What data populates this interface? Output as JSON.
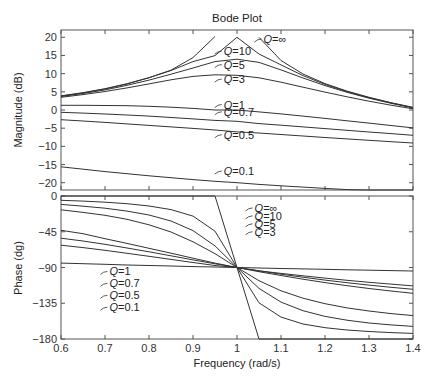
{
  "chart_data": [
    {
      "type": "line",
      "title": "Bode Plot",
      "xlabel": "Frequency (rad/s)",
      "ylabel": "Magnitude (dB)",
      "xlim": [
        0.6,
        1.4
      ],
      "ylim": [
        -22,
        22
      ],
      "x_ticks": [
        0.6,
        0.7,
        0.8,
        0.9,
        1,
        1.1,
        1.2,
        1.3,
        1.4
      ],
      "x_tick_labels": [
        "0.6",
        "0.7",
        "0.8",
        "0.9",
        "1",
        "1.1",
        "1.2",
        "1.3",
        "1.4"
      ],
      "y_ticks": [
        20,
        15,
        10,
        5,
        0,
        -5,
        -10,
        -15,
        -20
      ],
      "y_tick_labels": [
        "20",
        "15",
        "10",
        "5",
        "0",
        "−5",
        "−10",
        "−15",
        "−20"
      ],
      "grid": false,
      "x": [
        0.6,
        0.65,
        0.7,
        0.75,
        0.8,
        0.85,
        0.9,
        0.95,
        1.0,
        1.05,
        1.1,
        1.15,
        1.2,
        1.25,
        1.3,
        1.35,
        1.4
      ],
      "series": [
        {
          "name": "Q = ∞",
          "values": [
            3.88,
            4.75,
            5.85,
            7.23,
            8.87,
            10.94,
            14.42,
            20.2,
            null,
            20.0,
            13.62,
            9.91,
            7.27,
            5.2,
            3.48,
            2.0,
            0.72
          ]
        },
        {
          "name": "Q = 10",
          "values": [
            3.84,
            4.7,
            5.78,
            7.15,
            8.87,
            10.87,
            13.3,
            14.96,
            20.0,
            15.4,
            12.4,
            9.45,
            7.05,
            5.06,
            3.4,
            1.95,
            0.67
          ]
        },
        {
          "name": "Q = 5",
          "values": [
            3.72,
            4.55,
            5.54,
            6.78,
            8.23,
            9.84,
            11.56,
            13.3,
            13.98,
            13.1,
            11.04,
            8.79,
            6.72,
            4.86,
            3.25,
            1.83,
            0.58
          ]
        },
        {
          "name": "Q = 3",
          "values": [
            3.5,
            4.23,
            5.09,
            6.09,
            7.19,
            8.31,
            9.23,
            9.69,
            9.54,
            8.85,
            7.64,
            6.28,
            4.92,
            3.63,
            2.43,
            1.33,
            0.32
          ]
        },
        {
          "name": "Q = 1",
          "values": [
            1.29,
            1.29,
            1.25,
            1.17,
            1.02,
            0.78,
            0.44,
            0.01,
            0.0,
            -0.52,
            -1.08,
            -1.68,
            -2.31,
            -2.96,
            -3.61,
            -4.26,
            -4.91
          ]
        },
        {
          "name": "Q = 0.7",
          "values": [
            -0.64,
            -0.85,
            -1.09,
            -1.37,
            -1.69,
            -2.05,
            -2.44,
            -2.86,
            -3.1,
            -3.74,
            -4.19,
            -4.65,
            -5.12,
            -5.58,
            -6.04,
            -6.5,
            -6.96
          ]
        },
        {
          "name": "Q = 0.5",
          "values": [
            -2.66,
            -3.03,
            -3.42,
            -3.82,
            -4.23,
            -4.65,
            -5.07,
            -5.49,
            -6.02,
            -6.33,
            -6.74,
            -7.14,
            -7.55,
            -7.94,
            -8.33,
            -8.71,
            -9.08
          ]
        },
        {
          "name": "Q = 0.1",
          "values": [
            -15.62,
            -16.29,
            -16.93,
            -17.53,
            -18.1,
            -18.63,
            -19.13,
            -19.6,
            -20.0,
            -20.45,
            -20.85,
            -21.21,
            -21.56,
            -21.88,
            -22.19,
            -22.47,
            -22.74
          ]
        }
      ],
      "annotations": [
        {
          "text": "Q = ∞",
          "x": 1.06,
          "y": 19.5
        },
        {
          "text": "Q = 10",
          "x": 0.97,
          "y": 16.2
        },
        {
          "text": "Q = 5",
          "x": 0.97,
          "y": 12.5
        },
        {
          "text": "Q = 3",
          "x": 0.97,
          "y": 8.5
        },
        {
          "text": "Q = 1",
          "x": 0.97,
          "y": 1.5
        },
        {
          "text": "Q = 0.7",
          "x": 0.97,
          "y": -0.5
        },
        {
          "text": "Q = 0.5",
          "x": 0.97,
          "y": -6.8
        },
        {
          "text": "Q = 0.1",
          "x": 0.97,
          "y": -16.8
        }
      ]
    },
    {
      "type": "line",
      "title": "",
      "xlabel": "Frequency (rad/s)",
      "ylabel": "Phase (dg)",
      "xlim": [
        0.6,
        1.4
      ],
      "ylim": [
        -180,
        0
      ],
      "x_ticks": [
        0.6,
        0.7,
        0.8,
        0.9,
        1,
        1.1,
        1.2,
        1.3,
        1.4
      ],
      "x_tick_labels": [
        "0.6",
        "0.7",
        "0.8",
        "0.9",
        "1",
        "1.1",
        "1.2",
        "1.3",
        "1.4"
      ],
      "y_ticks": [
        0,
        -45,
        -90,
        -135,
        -180
      ],
      "y_tick_labels": [
        "0",
        "−45",
        "−90",
        "−135",
        "−180"
      ],
      "grid": false,
      "x": [
        0.6,
        0.65,
        0.7,
        0.75,
        0.8,
        0.85,
        0.9,
        0.95,
        1.0,
        1.05,
        1.1,
        1.15,
        1.2,
        1.25,
        1.3,
        1.35,
        1.4
      ],
      "series": [
        {
          "name": "Q = ∞",
          "values": [
            0,
            0,
            0,
            0,
            0,
            0,
            0,
            0,
            -90,
            -180,
            -180,
            -180,
            -180,
            -180,
            -180,
            -180,
            -180
          ]
        },
        {
          "name": "Q = 10",
          "values": [
            -5.36,
            -6.48,
            -7.8,
            -9.72,
            -12.53,
            -17.06,
            -25.35,
            -44.3,
            -90,
            -134.4,
            -152.4,
            -161.1,
            -165.8,
            -168.7,
            -170.6,
            -171.9,
            -172.9
          ]
        },
        {
          "name": "Q = 5",
          "values": [
            -10.62,
            -12.79,
            -15.34,
            -18.95,
            -23.96,
            -31.5,
            -43.5,
            -62.8,
            -90,
            -116.3,
            -133.5,
            -144.4,
            -151.6,
            -156.3,
            -159.8,
            -162.3,
            -164.2
          ]
        },
        {
          "name": "Q = 3",
          "values": [
            -17.35,
            -20.7,
            -24.35,
            -29.38,
            -36.2,
            -45.3,
            -57.6,
            -72.6,
            -90,
            -106.6,
            -119.3,
            -128.7,
            -135.6,
            -140.8,
            -144.8,
            -148.0,
            -150.5
          ]
        },
        {
          "name": "Q = 1",
          "values": [
            -43.15,
            -47.4,
            -53.7,
            -59.7,
            -65.8,
            -72.0,
            -78.3,
            -84.4,
            -90,
            -95.3,
            -100.1,
            -104.7,
            -109.0,
            -112.9,
            -116.4,
            -119.6,
            -122.5
          ]
        },
        {
          "name": "Q = 0.7",
          "values": [
            -53.1,
            -56.6,
            -60.8,
            -65.4,
            -70.3,
            -75.3,
            -80.4,
            -85.3,
            -90,
            -94.3,
            -98.4,
            -102.2,
            -105.8,
            -109.1,
            -112.1,
            -114.9,
            -117.4
          ]
        },
        {
          "name": "Q = 0.5",
          "values": [
            -61.9,
            -65.0,
            -68.4,
            -72.1,
            -75.9,
            -79.8,
            -83.7,
            -87.5,
            -90,
            -94.1,
            -97.4,
            -100.5,
            -103.4,
            -106.1,
            -108.6,
            -110.9,
            -113.1
          ]
        },
        {
          "name": "Q = 0.1",
          "values": [
            -84.5,
            -85.2,
            -86.0,
            -86.8,
            -87.5,
            -88.1,
            -88.9,
            -89.4,
            -90,
            -90.6,
            -91.2,
            -91.7,
            -92.3,
            -92.9,
            -93.4,
            -93.9,
            -94.4
          ]
        }
      ],
      "annotations": [
        {
          "text": "Q = ∞",
          "x": 1.04,
          "y": -15
        },
        {
          "text": "Q = 10",
          "x": 1.04,
          "y": -25
        },
        {
          "text": "Q = 5",
          "x": 1.04,
          "y": -35
        },
        {
          "text": "Q = 3",
          "x": 1.04,
          "y": -45
        },
        {
          "text": "Q = 1",
          "x": 0.71,
          "y": -95
        },
        {
          "text": "Q = 0.7",
          "x": 0.71,
          "y": -110
        },
        {
          "text": "Q = 0.5",
          "x": 0.71,
          "y": -125
        },
        {
          "text": "Q = 0.1",
          "x": 0.71,
          "y": -140
        }
      ]
    }
  ],
  "figure": {
    "title": "Bode Plot",
    "top_ylabel": "Magnitude (dB)",
    "bottom_ylabel": "Phase (dg)",
    "xlabel": "Frequency (rad/s)",
    "line_color": "#333333",
    "axis_color": "#555555",
    "background": "#ffffff"
  }
}
